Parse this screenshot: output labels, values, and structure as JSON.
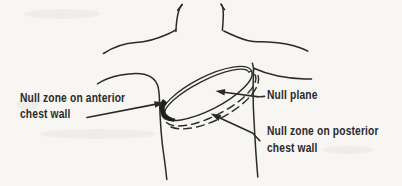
{
  "figure": {
    "type": "anatomical-line-diagram",
    "description_visible_content": "Torso outline with tilted disc (null plane) across the chest",
    "colors": {
      "background": "#f7f6f3",
      "ink": "#2a2a2a",
      "shade": "#1f1f1f"
    },
    "labels": {
      "anterior": {
        "line1": "Null zone on anterior",
        "line2": "chest wall"
      },
      "null_plane": "Null plane",
      "posterior": {
        "line1": "Null zone on posterior",
        "line2": "chest wall"
      }
    }
  }
}
